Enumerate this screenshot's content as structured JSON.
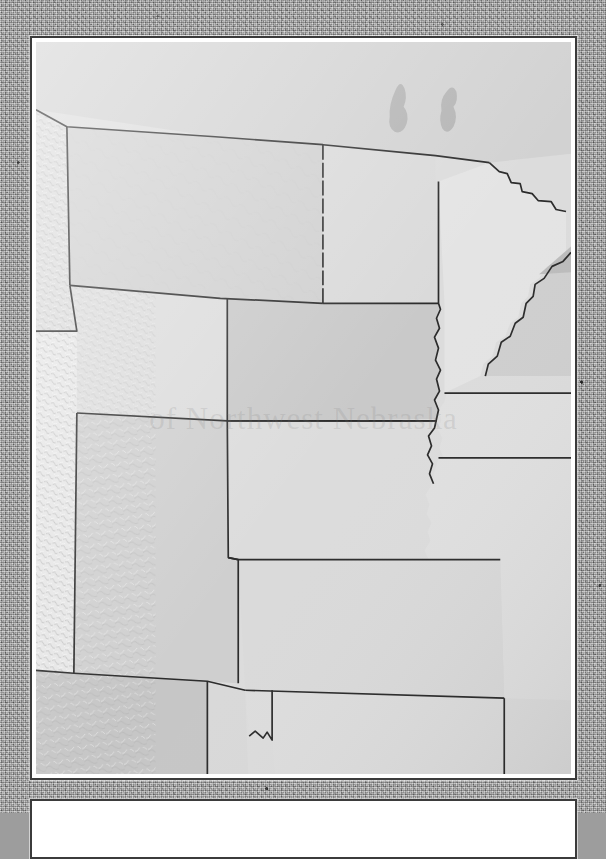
{
  "background": {
    "texture": "gray-noise-paper",
    "color": "#a2a2a2"
  },
  "frame": {
    "border_color": "#3b3b3b",
    "mat_color": "#ffffff"
  },
  "map": {
    "title": "",
    "watermark": "of Northwest Nebraska",
    "projection_note": "",
    "style": "shaded-relief grayscale",
    "colors": {
      "land_light": "#e2e2e2",
      "land_mid": "#d5d5d5",
      "land_dark": "#c9c9c9",
      "water": "#b4b4b4",
      "border_line": "#2b2b2b",
      "relief_shadow": "#bdbdbd"
    },
    "regions": [
      {
        "name": "Canada",
        "label": "",
        "fill": "#d2d2d2"
      },
      {
        "name": "Montana",
        "label": "",
        "fill": "#d0d0d0"
      },
      {
        "name": "Idaho",
        "label": "",
        "fill": "#dcdcdc"
      },
      {
        "name": "Wyoming",
        "label": "",
        "fill": "#dcdcdc"
      },
      {
        "name": "North Dakota",
        "label": "",
        "fill": "#dadada"
      },
      {
        "name": "South Dakota",
        "label": "",
        "fill": "#c9c9c9"
      },
      {
        "name": "Nebraska",
        "label": "",
        "fill": "#dcdcdc"
      },
      {
        "name": "Minnesota",
        "label": "",
        "fill": "#e4e4e4"
      },
      {
        "name": "Iowa",
        "label": "",
        "fill": "#e0e0e0"
      },
      {
        "name": "Wisconsin",
        "label": "",
        "fill": "#cfcfcf"
      },
      {
        "name": "Colorado",
        "label": "",
        "fill": "#cfcfcf"
      },
      {
        "name": "Utah",
        "label": "",
        "fill": "#e6e6e6"
      },
      {
        "name": "Kansas",
        "label": "",
        "fill": "#dadada"
      },
      {
        "name": "Missouri",
        "label": "",
        "fill": "#e0e0e0"
      },
      {
        "name": "New Mexico",
        "label": "",
        "fill": "#c6c6c6"
      },
      {
        "name": "Oklahoma",
        "label": "",
        "fill": "#dddddd"
      },
      {
        "name": "Texas",
        "label": "",
        "fill": "#d9d9d9"
      }
    ],
    "water_bodies": [
      {
        "name": "Lake Winnipegosis",
        "fill": "#b4b4b4"
      },
      {
        "name": "Lake Manitoba",
        "fill": "#b4b4b4"
      },
      {
        "name": "Lake of the Woods",
        "fill": "#b4b4b4"
      },
      {
        "name": "Lake Superior",
        "fill": "#bcbcbc"
      }
    ]
  },
  "lower_panel": {
    "content": ""
  }
}
